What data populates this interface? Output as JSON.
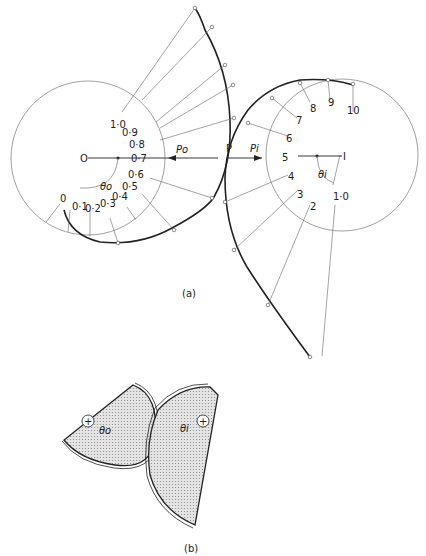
{
  "figure": {
    "part_a": {
      "caption": "(a)",
      "left_cam": {
        "center_label": "O",
        "force_label": "Po",
        "angle_label": "θo",
        "scale_labels": [
          "0",
          "0·1",
          "0·2",
          "0·3",
          "0·4",
          "0·5",
          "0·6",
          "0·7",
          "0·8",
          "0·9",
          "1·0"
        ]
      },
      "right_cam": {
        "center_label": "I",
        "force_label": "Pi",
        "angle_label": "θi",
        "scale_labels": [
          "1·0",
          "2",
          "3",
          "4",
          "5",
          "6",
          "7",
          "8",
          "9",
          "10"
        ]
      },
      "contact_label": "P"
    },
    "part_b": {
      "caption": "(b)",
      "left_label": "θo",
      "right_label": "θi",
      "pivot_symbol": "+"
    }
  }
}
